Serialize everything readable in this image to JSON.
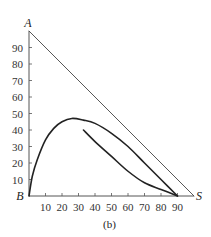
{
  "chart_data": {
    "type": "line",
    "title": "",
    "caption": "(b)",
    "xlabel": "",
    "ylabel": "",
    "xlim": [
      0,
      100
    ],
    "ylim": [
      0,
      100
    ],
    "grid": false,
    "x_ticks": [
      10,
      20,
      30,
      40,
      50,
      60,
      70,
      80,
      90
    ],
    "y_ticks": [
      10,
      20,
      30,
      40,
      50,
      60,
      70,
      80,
      90
    ],
    "vertex_labels": {
      "top": "A",
      "origin": "B",
      "right": "S"
    },
    "series": [
      {
        "name": "hypotenuse A-S",
        "points": [
          [
            0,
            100
          ],
          [
            100,
            0
          ]
        ]
      },
      {
        "name": "upper curve",
        "points": [
          [
            0,
            0
          ],
          [
            2,
            12
          ],
          [
            5,
            22
          ],
          [
            10,
            34
          ],
          [
            15,
            41
          ],
          [
            20,
            45
          ],
          [
            26,
            47
          ],
          [
            33,
            46
          ],
          [
            40,
            44
          ],
          [
            50,
            38
          ],
          [
            60,
            30
          ],
          [
            70,
            20
          ],
          [
            80,
            10
          ],
          [
            90,
            0
          ]
        ]
      },
      {
        "name": "lower curve",
        "points": [
          [
            33,
            40
          ],
          [
            40,
            33
          ],
          [
            50,
            24
          ],
          [
            60,
            15
          ],
          [
            70,
            8
          ],
          [
            80,
            4
          ],
          [
            90,
            0
          ]
        ]
      }
    ]
  },
  "plot_area": {
    "origin_px": [
      29,
      196
    ],
    "px_per_unit_x": 1.65,
    "px_per_unit_y": 1.65
  },
  "colors": {
    "axis": "#555555",
    "curve": "#222222",
    "hypotenuse": "#444444"
  }
}
